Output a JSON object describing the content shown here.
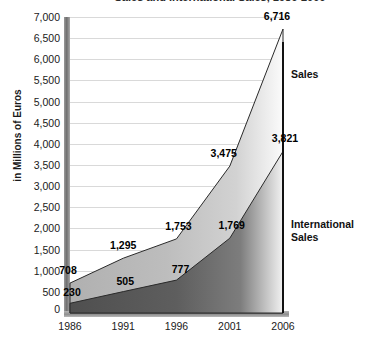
{
  "chart_data": {
    "type": "area",
    "title": "Sales and International Sales, 1986-2006",
    "xlabel": "",
    "ylabel": "in Millions of Euros",
    "categories": [
      "1986",
      "1991",
      "1996",
      "2001",
      "2006"
    ],
    "x": [
      1986,
      1991,
      1996,
      2001,
      2006
    ],
    "ylim": [
      0,
      7000
    ],
    "yticks": [
      "500",
      "1,000",
      "1,500",
      "2,000",
      "2,500",
      "3,000",
      "3,500",
      "4,000",
      "4,500",
      "5,000",
      "5,500",
      "6,000",
      "6,500",
      "7,000"
    ],
    "ytick_values": [
      500,
      1000,
      1500,
      2000,
      2500,
      3000,
      3500,
      4000,
      4500,
      5000,
      5500,
      6000,
      6500,
      7000
    ],
    "zero_label": "0",
    "grid": true,
    "legend_position": "right",
    "series": [
      {
        "name": "Sales",
        "values": [
          708,
          1753,
          1753,
          3475,
          6716
        ],
        "labels": [
          "708",
          "1,295",
          "1,753",
          "3,475",
          "6,716"
        ],
        "data": [
          708,
          1295,
          1753,
          3475,
          6716
        ],
        "color": "#b6b6b6"
      },
      {
        "name": "International Sales",
        "values": [
          230,
          505,
          777,
          1769,
          3821
        ],
        "labels": [
          "230",
          "505",
          "777",
          "1,769",
          "3,821"
        ],
        "data": [
          230,
          505,
          777,
          1769,
          3821
        ],
        "color": "#5c5c5c"
      }
    ],
    "annotations": {
      "sales_legend": "Sales",
      "international_legend": "International\nSales"
    }
  },
  "colors": {
    "sales_band": "#b6b6b6",
    "international_band": "#5c5c5c",
    "gridline": "#d9d9d9",
    "axis": "#7a7a7a",
    "text": "#1a1a1a"
  }
}
